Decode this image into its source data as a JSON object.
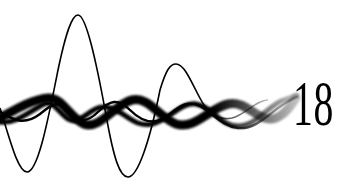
{
  "graphic": {
    "label": "18",
    "colors": {
      "ink": "#000000",
      "background": "#ffffff"
    }
  }
}
